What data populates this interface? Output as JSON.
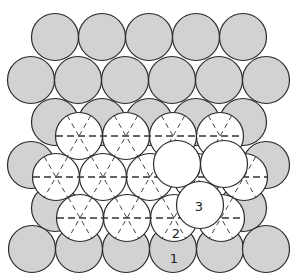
{
  "diagram": {
    "radius": 23.5,
    "colors": {
      "layer1": "#d2d2d2",
      "layer2": "#ffffff",
      "layer3": "#ffffff",
      "outline": "#2a2a2a"
    },
    "layer1_rows": [
      {
        "y": 37,
        "x": [
          55,
          102,
          149,
          196,
          243
        ]
      },
      {
        "y": 80,
        "x": [
          31,
          78,
          125,
          172,
          219,
          266
        ]
      },
      {
        "y": 122,
        "x": [
          55,
          102,
          149,
          196,
          243
        ]
      },
      {
        "y": 165,
        "x": [
          31,
          266
        ]
      },
      {
        "y": 208,
        "x": [
          55,
          243
        ]
      },
      {
        "y": 249,
        "x": [
          32,
          79,
          126,
          173,
          220,
          266
        ]
      }
    ],
    "layer2_rows": [
      {
        "y": 136,
        "x": [
          79,
          126,
          173,
          220
        ],
        "dash_from": 56,
        "dash_to": 244
      },
      {
        "y": 177,
        "x": [
          56,
          103,
          150,
          197,
          244
        ],
        "dash_from": 33,
        "dash_to": 268
      },
      {
        "y": 218,
        "x": [
          80,
          127,
          174,
          221
        ],
        "dash_from": 57,
        "dash_to": 245
      }
    ],
    "layer3": [
      {
        "x": 177,
        "y": 164
      },
      {
        "x": 224,
        "y": 164
      },
      {
        "x": 200,
        "y": 205
      }
    ],
    "labels": [
      {
        "text": "3",
        "x": 199,
        "y": 207
      },
      {
        "text": "2",
        "x": 176,
        "y": 234
      },
      {
        "text": "1",
        "x": 174,
        "y": 259
      }
    ]
  }
}
